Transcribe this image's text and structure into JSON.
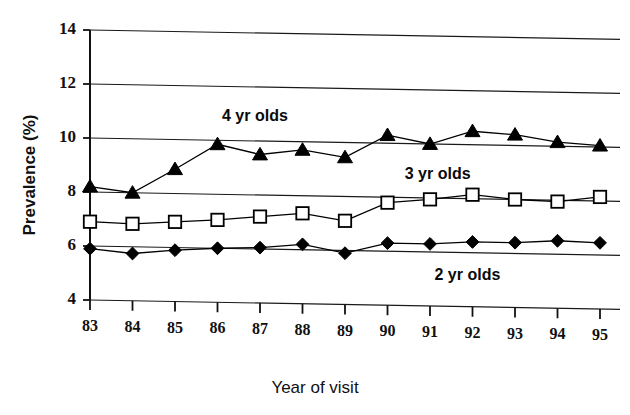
{
  "chart_data": {
    "type": "line",
    "title": "",
    "xlabel": "Year of visit",
    "ylabel": "Prevalence (%)",
    "categories": [
      "83",
      "84",
      "85",
      "86",
      "87",
      "88",
      "89",
      "90",
      "91",
      "92",
      "93",
      "94",
      "95"
    ],
    "x": [
      83,
      84,
      85,
      86,
      87,
      88,
      89,
      90,
      91,
      92,
      93,
      94,
      95
    ],
    "ylim": [
      4,
      14
    ],
    "yticks": [
      4,
      6,
      8,
      10,
      12,
      14
    ],
    "ytick_labels": [
      "4",
      "6",
      "8",
      "10",
      "12",
      "14"
    ],
    "grid": "horizontal",
    "legend_position": "inline-annotations",
    "series": [
      {
        "name": "4 yr olds",
        "marker": "filled-triangle",
        "color": "#000000",
        "label_text": "4 yr olds",
        "values": [
          8.2,
          8.0,
          8.9,
          9.85,
          9.5,
          9.7,
          9.45,
          10.3,
          10.0,
          10.5,
          10.4,
          10.15,
          10.05
        ]
      },
      {
        "name": "3 yr olds",
        "marker": "open-square",
        "color": "#000000",
        "label_text": "3 yr olds",
        "values": [
          6.9,
          6.85,
          6.95,
          7.05,
          7.2,
          7.35,
          7.1,
          7.8,
          7.95,
          8.15,
          8.0,
          7.95,
          8.15
        ]
      },
      {
        "name": "2 yr olds",
        "marker": "filled-diamond",
        "color": "#000000",
        "label_text": "2 yr olds",
        "values": [
          5.9,
          5.75,
          5.9,
          6.0,
          6.05,
          6.2,
          5.9,
          6.3,
          6.3,
          6.4,
          6.4,
          6.5,
          6.45
        ]
      }
    ],
    "annotations": [
      {
        "text": "4 yr olds",
        "x": 87.0,
        "y": 10.9
      },
      {
        "text": "3 yr olds",
        "x": 91.3,
        "y": 8.85
      },
      {
        "text": "2 yr olds",
        "x": 92.0,
        "y": 5.15
      }
    ]
  }
}
